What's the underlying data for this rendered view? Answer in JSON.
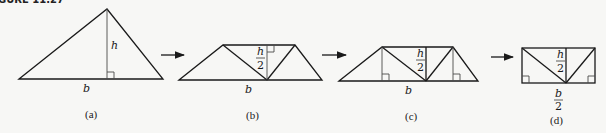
{
  "figure": {
    "title_fragment": "GURE 11.27",
    "panels": [
      {
        "id": "a",
        "caption": "(a)",
        "base_label": "b",
        "height_label": "h"
      },
      {
        "id": "b",
        "caption": "(b)",
        "base_label": "b",
        "height_label_num": "h",
        "height_label_den": "2"
      },
      {
        "id": "c",
        "caption": "(c)",
        "base_label": "b",
        "height_label_num": "h",
        "height_label_den": "2"
      },
      {
        "id": "d",
        "caption": "(d)",
        "base_label_num": "b",
        "base_label_den": "2",
        "height_label_num": "h",
        "height_label_den": "2"
      }
    ],
    "arrows": [
      "a-to-b",
      "b-to-c",
      "c-to-d"
    ]
  }
}
